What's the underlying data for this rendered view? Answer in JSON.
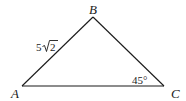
{
  "diagram": {
    "type": "triangle",
    "vertices": {
      "A": {
        "label": "A",
        "x": 22,
        "y": 86
      },
      "B": {
        "label": "B",
        "x": 93,
        "y": 17
      },
      "C": {
        "label": "C",
        "x": 164,
        "y": 86
      }
    },
    "side_labels": {
      "AB": {
        "coef": "5",
        "radicand": "2"
      }
    },
    "angle_labels": {
      "C": {
        "text": "45°"
      }
    },
    "colors": {
      "stroke": "#1a1a1a",
      "background": "#ffffff"
    }
  }
}
